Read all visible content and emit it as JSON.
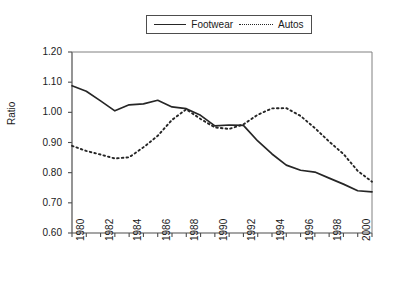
{
  "chart_data": {
    "type": "line",
    "title": "",
    "xlabel": "",
    "ylabel": "Ratio",
    "ylim": [
      0.6,
      1.2
    ],
    "ytick_step": 0.1,
    "yticks": [
      "0.60",
      "0.70",
      "0.80",
      "0.90",
      "1.00",
      "1.10",
      "1.20"
    ],
    "xlim": [
      1980,
      2001
    ],
    "xticks_all": [
      1980,
      1981,
      1982,
      1983,
      1984,
      1985,
      1986,
      1987,
      1988,
      1989,
      1990,
      1991,
      1992,
      1993,
      1994,
      1995,
      1996,
      1997,
      1998,
      1999,
      2000,
      2001
    ],
    "xtick_labels": [
      "1980",
      "1982",
      "1984",
      "1986",
      "1988",
      "1990",
      "1992",
      "1994",
      "1996",
      "1998",
      "2000"
    ],
    "xtick_label_years": [
      1980,
      1982,
      1984,
      1986,
      1988,
      1990,
      1992,
      1994,
      1996,
      1998,
      2000
    ],
    "xtick_label_rotation": -90,
    "grid": false,
    "legend_position": "top-center",
    "x": [
      1980,
      1981,
      1982,
      1983,
      1984,
      1985,
      1986,
      1987,
      1988,
      1989,
      1990,
      1991,
      1992,
      1993,
      1994,
      1995,
      1996,
      1997,
      1998,
      1999,
      2000,
      2001
    ],
    "series": [
      {
        "name": "Footwear",
        "style": "solid",
        "color": "#262626",
        "values": [
          1.088,
          1.07,
          1.038,
          1.005,
          1.025,
          1.028,
          1.04,
          1.018,
          1.012,
          0.99,
          0.955,
          0.958,
          0.957,
          0.905,
          0.862,
          0.825,
          0.808,
          0.802,
          0.782,
          0.762,
          0.74,
          0.736
        ]
      },
      {
        "name": "Autos",
        "style": "dotted",
        "color": "#262626",
        "values": [
          0.889,
          0.872,
          0.86,
          0.847,
          0.851,
          0.884,
          0.922,
          0.975,
          1.01,
          0.978,
          0.95,
          0.945,
          0.96,
          0.992,
          1.013,
          1.014,
          0.988,
          0.948,
          0.903,
          0.862,
          0.806,
          0.77
        ]
      }
    ]
  },
  "legend": {
    "entries": [
      {
        "label": "Footwear",
        "style": "solid"
      },
      {
        "label": "Autos",
        "style": "dotted"
      }
    ]
  }
}
